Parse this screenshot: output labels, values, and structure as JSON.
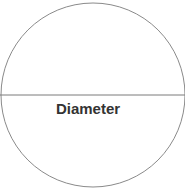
{
  "diagram": {
    "shape": "circle",
    "label": "Diameter",
    "colors": {
      "stroke": "#8a8a8a",
      "text": "#333333",
      "background": "#ffffff"
    }
  }
}
